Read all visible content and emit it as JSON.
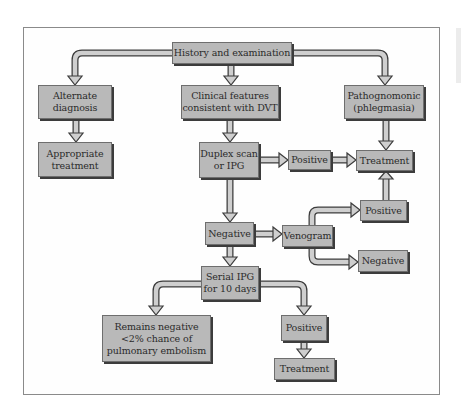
{
  "diagram": {
    "type": "flowchart",
    "colors": {
      "box_fill": "#b9b9b9",
      "box_border": "#6e6e6e",
      "box_shadow": "#3c3c3c",
      "arrow_fill": "#c8c8c8",
      "frame_border": "#8a8a8a"
    },
    "nodes": {
      "history": "History and examination",
      "alternate": "Alternate\ndiagnosis",
      "clinical": "Clinical features\nconsistent with DVT",
      "pathognomonic": "Pathognomonic\n(phlegmasia)",
      "appropriate": "Appropriate\ntreatment",
      "duplex": "Duplex scan\nor IPG",
      "positive1": "Positive",
      "treatment1": "Treatment",
      "positive2": "Positive",
      "negative1": "Negative",
      "venogram": "Venogram",
      "negative2": "Negative",
      "serial": "Serial IPG\nfor 10 days",
      "remains": "Remains negative\n<2% chance of\npulmonary embolism",
      "positive3": "Positive",
      "treatment3": "Treatment"
    },
    "edges": [
      [
        "history",
        "alternate"
      ],
      [
        "history",
        "clinical"
      ],
      [
        "history",
        "pathognomonic"
      ],
      [
        "alternate",
        "appropriate"
      ],
      [
        "clinical",
        "duplex"
      ],
      [
        "pathognomonic",
        "treatment1"
      ],
      [
        "duplex",
        "positive1"
      ],
      [
        "positive1",
        "treatment1"
      ],
      [
        "duplex",
        "negative1"
      ],
      [
        "negative1",
        "venogram"
      ],
      [
        "venogram",
        "positive2"
      ],
      [
        "venogram",
        "negative2"
      ],
      [
        "positive2",
        "treatment1"
      ],
      [
        "negative1",
        "serial"
      ],
      [
        "serial",
        "remains"
      ],
      [
        "serial",
        "positive3"
      ],
      [
        "positive3",
        "treatment3"
      ]
    ]
  }
}
